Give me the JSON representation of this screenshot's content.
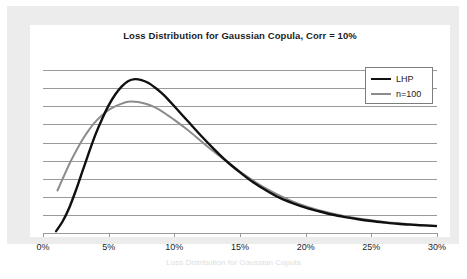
{
  "chart_data": {
    "type": "line",
    "title": "Loss Distribution for Gaussian Copula, Corr = 10%",
    "xlabel": "",
    "ylabel": "",
    "xlim": [
      0,
      30
    ],
    "ylim": [
      0,
      10
    ],
    "grid": true,
    "gridlines_y": [
      1,
      2,
      3,
      4,
      5,
      6,
      7,
      8,
      9
    ],
    "xticks": [
      0,
      5,
      10,
      15,
      20,
      25,
      30
    ],
    "xtick_labels": [
      "0%",
      "5%",
      "10%",
      "15%",
      "20%",
      "25%",
      "30%"
    ],
    "ytick_labels": [],
    "legend_position": "top-right",
    "colors": {
      "lhp": "#101010",
      "n100": "#8c8c8c",
      "gridline": "#9a9a9a",
      "axis": "#9a9a9a",
      "plot_background": "#ffffff",
      "frame_background": "#ececed",
      "text": "#1d1d1d"
    },
    "series": [
      {
        "name": "LHP",
        "color": "#101010",
        "line_width": 2.4,
        "x": [
          1.0,
          1.5,
          2.0,
          2.5,
          3.0,
          3.5,
          4.0,
          4.5,
          5.0,
          5.5,
          6.0,
          6.5,
          7.0,
          7.5,
          8.0,
          8.5,
          9.0,
          9.5,
          10.0,
          11.0,
          12.0,
          13.0,
          14.0,
          15.0,
          16.0,
          17.0,
          18.0,
          19.0,
          20.0,
          21.0,
          22.0,
          23.0,
          24.0,
          25.0,
          26.0,
          27.0,
          28.0,
          29.0,
          30.0
        ],
        "y": [
          0.1,
          0.65,
          1.4,
          2.35,
          3.4,
          4.45,
          5.45,
          6.3,
          7.05,
          7.65,
          8.1,
          8.4,
          8.5,
          8.45,
          8.3,
          8.05,
          7.75,
          7.4,
          7.0,
          6.2,
          5.4,
          4.65,
          3.95,
          3.35,
          2.8,
          2.35,
          1.95,
          1.65,
          1.4,
          1.2,
          1.02,
          0.88,
          0.76,
          0.66,
          0.58,
          0.51,
          0.46,
          0.42,
          0.38
        ]
      },
      {
        "name": "n=100",
        "color": "#8c8c8c",
        "line_width": 2.0,
        "x": [
          1.1,
          1.5,
          2.0,
          2.5,
          3.0,
          3.5,
          4.0,
          4.5,
          5.0,
          5.5,
          6.0,
          6.5,
          7.0,
          7.5,
          8.0,
          8.5,
          9.0,
          9.5,
          10.0,
          11.0,
          12.0,
          13.0,
          14.0,
          15.0,
          16.0,
          17.0,
          18.0,
          19.0,
          20.0,
          21.0,
          22.0,
          23.0,
          24.0,
          25.0,
          26.0,
          27.0,
          28.0,
          29.0,
          30.0
        ],
        "y": [
          2.35,
          3.0,
          3.8,
          4.5,
          5.15,
          5.7,
          6.15,
          6.5,
          6.8,
          7.0,
          7.15,
          7.25,
          7.25,
          7.2,
          7.1,
          6.95,
          6.75,
          6.5,
          6.25,
          5.7,
          5.1,
          4.5,
          3.95,
          3.4,
          2.9,
          2.45,
          2.08,
          1.75,
          1.48,
          1.26,
          1.08,
          0.93,
          0.8,
          0.7,
          0.61,
          0.54,
          0.48,
          0.43,
          0.4
        ]
      }
    ]
  },
  "legend": {
    "items": [
      {
        "label": "LHP",
        "color": "#101010",
        "width": 2.6
      },
      {
        "label": "n=100",
        "color": "#8c8c8c",
        "width": 2.0
      }
    ]
  },
  "caption": {
    "text": "Loss Distribution for Gaussian Copula"
  }
}
